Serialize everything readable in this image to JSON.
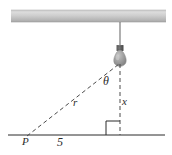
{
  "figure": {
    "labels": {
      "angle": "θ",
      "height": "x",
      "hypotenuse": "r",
      "point": "P",
      "base_distance": "5"
    },
    "colors": {
      "ceiling_light": "#d6d6d6",
      "ceiling_dark": "#a8a8a8",
      "line": "#2b2b2b",
      "dashed": "#555555",
      "bulb_glass": "#9a9a9a",
      "bulb_cap": "#4a4a4a",
      "cord": "#6e6e6e",
      "background": "#ffffff"
    },
    "geometry": {
      "ceiling": {
        "x1": 11,
        "y1": 10,
        "x2": 166,
        "y2": 22
      },
      "cord": {
        "x": 120,
        "y1": 22,
        "y2": 46
      },
      "bulb": {
        "cx": 120,
        "cy": 58,
        "rx": 7,
        "ry": 8
      },
      "ground": {
        "x1": 8,
        "y1": 135,
        "x2": 165,
        "y2": 135
      },
      "vertical_dashed": {
        "x": 120,
        "y1": 64,
        "y2": 135
      },
      "diagonal_dashed": {
        "x1": 27,
        "y1": 136,
        "x2": 119,
        "y2": 64
      },
      "right_angle_box": {
        "x": 106,
        "y": 121,
        "size": 14
      },
      "point_p": {
        "x": 27,
        "y": 136
      }
    }
  }
}
